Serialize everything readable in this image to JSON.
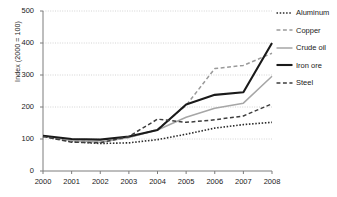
{
  "chart_data": {
    "type": "line",
    "title": "",
    "subtitle": "",
    "xlabel": "",
    "ylabel": "Index (2000 = 100)",
    "x": [
      2000,
      2001,
      2002,
      2003,
      2004,
      2005,
      2006,
      2007,
      2008
    ],
    "xticklabels": [
      "2000",
      "2001",
      "2002",
      "2003",
      "2004",
      "2005",
      "2006",
      "2007",
      "2008"
    ],
    "yticklabels": [
      "0",
      "100",
      "200",
      "300",
      "400",
      "500"
    ],
    "yticks": [
      0,
      100,
      200,
      300,
      400,
      500
    ],
    "xlim": [
      2000,
      2008
    ],
    "ylim": [
      0,
      500
    ],
    "grid": "horizontal-dotted",
    "legend_position": "right",
    "series": [
      {
        "name": "Aluminum",
        "style": "dotted",
        "color": "#2b2b2b",
        "width": 1.6,
        "values": [
          108,
          92,
          86,
          88,
          98,
          115,
          134,
          145,
          152
        ]
      },
      {
        "name": "Copper",
        "style": "dashed",
        "color": "#9a9a9a",
        "width": 1.5,
        "values": [
          110,
          95,
          90,
          105,
          130,
          205,
          320,
          330,
          368
        ]
      },
      {
        "name": "Crude oil",
        "style": "solid",
        "color": "#a6a6a6",
        "width": 1.5,
        "values": [
          110,
          95,
          90,
          105,
          128,
          168,
          196,
          212,
          296
        ]
      },
      {
        "name": "Iron ore",
        "style": "solid",
        "color": "#1a1a1a",
        "width": 2.1,
        "values": [
          110,
          100,
          98,
          108,
          128,
          208,
          238,
          246,
          400
        ]
      },
      {
        "name": "Steel",
        "style": "dashed",
        "color": "#3d3d3d",
        "width": 1.5,
        "values": [
          108,
          90,
          88,
          108,
          162,
          152,
          160,
          172,
          210
        ]
      }
    ]
  },
  "axis": {
    "y_title": "Index (2000 = 100)"
  }
}
